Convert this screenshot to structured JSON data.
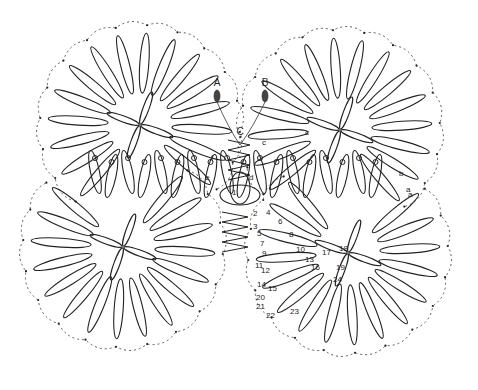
{
  "diagram": {
    "colors": {
      "ink": "#222222",
      "background": "#ffffff"
    },
    "shuttles": [
      {
        "label": "A",
        "x": 217,
        "y": 88
      },
      {
        "label": "B",
        "x": 265,
        "y": 88
      }
    ],
    "center_label": {
      "label": "C",
      "x": 240,
      "y": 135
    },
    "letter_labels": [
      {
        "label": "f",
        "x": 211,
        "y": 160
      },
      {
        "label": "c",
        "x": 262,
        "y": 145
      },
      {
        "label": "c",
        "x": 305,
        "y": 135
      },
      {
        "label": "d",
        "x": 249,
        "y": 180
      },
      {
        "label": "e",
        "x": 205,
        "y": 180
      },
      {
        "label": "b",
        "x": 399,
        "y": 176
      },
      {
        "label": "a",
        "x": 408,
        "y": 197
      },
      {
        "label": "a",
        "x": 406,
        "y": 192
      }
    ],
    "number_labels": [
      {
        "label": "1",
        "x": 232,
        "y": 195
      },
      {
        "label": "2",
        "x": 253,
        "y": 216
      },
      {
        "label": "3",
        "x": 253,
        "y": 229
      },
      {
        "label": "4",
        "x": 266,
        "y": 215
      },
      {
        "label": "5",
        "x": 257,
        "y": 236
      },
      {
        "label": "6",
        "x": 278,
        "y": 224
      },
      {
        "label": "7",
        "x": 260,
        "y": 246
      },
      {
        "label": "8",
        "x": 289,
        "y": 237
      },
      {
        "label": "9",
        "x": 262,
        "y": 256
      },
      {
        "label": "10",
        "x": 296,
        "y": 252
      },
      {
        "label": "11",
        "x": 255,
        "y": 268
      },
      {
        "label": "12",
        "x": 261,
        "y": 273
      },
      {
        "label": "13",
        "x": 305,
        "y": 262
      },
      {
        "label": "14",
        "x": 257,
        "y": 287
      },
      {
        "label": "15",
        "x": 268,
        "y": 291
      },
      {
        "label": "16",
        "x": 311,
        "y": 270
      },
      {
        "label": "17",
        "x": 322,
        "y": 255
      },
      {
        "label": "18",
        "x": 339,
        "y": 251
      },
      {
        "label": "19",
        "x": 336,
        "y": 270
      },
      {
        "label": "20",
        "x": 256,
        "y": 300
      },
      {
        "label": "21",
        "x": 256,
        "y": 309
      },
      {
        "label": "22",
        "x": 266,
        "y": 318
      },
      {
        "label": "23",
        "x": 290,
        "y": 314
      },
      {
        "label": "24",
        "x": 333,
        "y": 282
      }
    ],
    "motifs": [
      {
        "name": "top-left-flower",
        "cx": 140,
        "cy": 125
      },
      {
        "name": "top-right-flower",
        "cx": 340,
        "cy": 130
      },
      {
        "name": "bottom-left-flower",
        "cx": 123,
        "cy": 247
      },
      {
        "name": "bottom-right-flower",
        "cx": 348,
        "cy": 253
      }
    ]
  }
}
